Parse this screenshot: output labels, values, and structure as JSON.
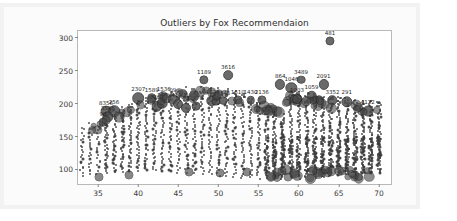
{
  "chart_data": {
    "type": "scatter",
    "title": "Outliers by Fox Recommendaion",
    "xlabel": "",
    "ylabel": "",
    "xlim": [
      32.5,
      71.5
    ],
    "ylim": [
      78,
      310
    ],
    "xticks": [
      35,
      40,
      45,
      50,
      55,
      60,
      65,
      70
    ],
    "yticks": [
      100,
      150,
      200,
      250,
      300
    ],
    "grid": false,
    "legend": null,
    "marker_color": "#3b3b3b",
    "outlier_color": "#4a4a4a",
    "labeled_outliers": [
      {
        "label": "481",
        "x": 63.9,
        "y": 295
      },
      {
        "label": "1189",
        "x": 48.2,
        "y": 236
      },
      {
        "label": "3616",
        "x": 51.2,
        "y": 243
      },
      {
        "label": "864",
        "x": 57.7,
        "y": 229
      },
      {
        "label": "3489",
        "x": 60.3,
        "y": 236
      },
      {
        "label": "1046",
        "x": 59.1,
        "y": 224
      },
      {
        "label": "2091",
        "x": 63.1,
        "y": 229
      },
      {
        "label": "2307",
        "x": 40.0,
        "y": 208
      },
      {
        "label": "1589",
        "x": 41.7,
        "y": 208
      },
      {
        "label": "1536",
        "x": 43.2,
        "y": 210
      },
      {
        "label": "09",
        "x": 44.3,
        "y": 207
      },
      {
        "label": "8356",
        "x": 36.0,
        "y": 188
      },
      {
        "label": "256",
        "x": 37.0,
        "y": 188
      },
      {
        "label": "3586",
        "x": 36.2,
        "y": 180
      },
      {
        "label": "90",
        "x": 35.6,
        "y": 172
      },
      {
        "label": "2305",
        "x": 42.3,
        "y": 196
      },
      {
        "label": "344",
        "x": 43.0,
        "y": 200
      },
      {
        "label": "4100",
        "x": 45.0,
        "y": 200
      },
      {
        "label": "24",
        "x": 46.0,
        "y": 194
      },
      {
        "label": "1270",
        "x": 47.2,
        "y": 196
      },
      {
        "label": "4124",
        "x": 49.2,
        "y": 204
      },
      {
        "label": "1298",
        "x": 49.7,
        "y": 203
      },
      {
        "label": "8146",
        "x": 50.6,
        "y": 204
      },
      {
        "label": "1610",
        "x": 52.4,
        "y": 206
      },
      {
        "label": "1430",
        "x": 54.0,
        "y": 205
      },
      {
        "label": "2136",
        "x": 55.4,
        "y": 205
      },
      {
        "label": "1003",
        "x": 59.8,
        "y": 207
      },
      {
        "label": "1059",
        "x": 61.6,
        "y": 212
      },
      {
        "label": "3352",
        "x": 64.2,
        "y": 205
      },
      {
        "label": "291",
        "x": 66.0,
        "y": 203
      },
      {
        "label": "4122",
        "x": 68.6,
        "y": 189
      }
    ]
  }
}
